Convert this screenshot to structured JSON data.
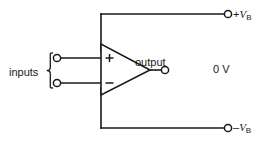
{
  "diagram": {
    "type": "circuit-schematic",
    "line_color": "#1a1a1a",
    "text_color": "#1a1a1a",
    "background": "#ffffff"
  },
  "labels": {
    "inputs": "inputs",
    "output": "output",
    "zero_volt": "0 V",
    "supply_positive_sign": "+",
    "supply_positive_symbol": "V",
    "supply_positive_subscript": "B",
    "supply_negative_sign": "–",
    "supply_negative_symbol": "V",
    "supply_negative_subscript": "B"
  },
  "opamp": {
    "noninverting_marker": "+",
    "inverting_marker": "–",
    "apex_x": 150,
    "left_edge_x": 101,
    "top_y": 44,
    "bottom_y": 95
  },
  "terminals": [
    {
      "name": "input-noninverting",
      "x": 57,
      "y": 58,
      "style": "open-circle"
    },
    {
      "name": "input-inverting",
      "x": 57,
      "y": 83,
      "style": "open-circle"
    },
    {
      "name": "output",
      "x": 165,
      "y": 70,
      "style": "open-circle"
    },
    {
      "name": "supply-positive",
      "x": 228,
      "y": 14,
      "style": "open-circle"
    },
    {
      "name": "supply-negative",
      "x": 228,
      "y": 128,
      "style": "open-circle"
    }
  ],
  "wires": {
    "top_rail_y": 14,
    "bottom_rail_y": 128,
    "supply_stub_x": 101,
    "output_y": 70
  }
}
